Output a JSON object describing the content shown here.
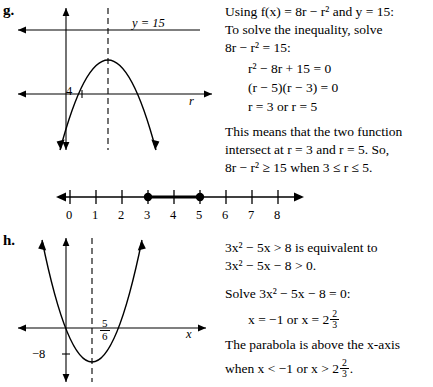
{
  "problems": {
    "g": {
      "label": "g.",
      "graph": {
        "curve_label": "y = 15",
        "axis_x_label": "r",
        "tick_label": "4"
      },
      "text_lines": [
        "Using f(x) = 8r − r² and y = 15:",
        "To solve the inequality, solve",
        "8r − r² = 15:"
      ],
      "work_lines": [
        "r² − 8r + 15 = 0",
        "(r − 5)(r − 3) = 0",
        "r = 3 or r = 5"
      ],
      "conclusion_lines": [
        "This means that the two function",
        "intersect at r = 3 and r = 5. So,",
        "8r − r² ≥ 15 when 3 ≤ r ≤ 5."
      ],
      "numberline": {
        "labels": [
          "0",
          "1",
          "2",
          "3",
          "4",
          "5",
          "6",
          "7",
          "8"
        ],
        "solid_points": [
          3,
          5
        ],
        "segment": [
          3,
          5
        ]
      }
    },
    "h": {
      "label": "h.",
      "graph": {
        "axis_x_label": "x",
        "vertex_label_num": "5",
        "vertex_label_den": "6",
        "y_intercept_label": "−8"
      },
      "text_lines": [
        "3x² − 5x > 8 is equivalent to",
        "3x² − 5x − 8 > 0.",
        "Solve 3x² − 5x − 8 = 0:"
      ],
      "solution_prefix": "x = −1 or x = 2",
      "solution_frac_num": "2",
      "solution_frac_den": "3",
      "conclusion_prefix": "The parabola is above the x-axis",
      "conclusion_line2_prefix": "when x < −1 or x > 2",
      "conclusion_frac_num": "2",
      "conclusion_frac_den": "3",
      "conclusion_suffix": "."
    }
  },
  "colors": {
    "ink": "#000000",
    "background": "#ffffff"
  }
}
